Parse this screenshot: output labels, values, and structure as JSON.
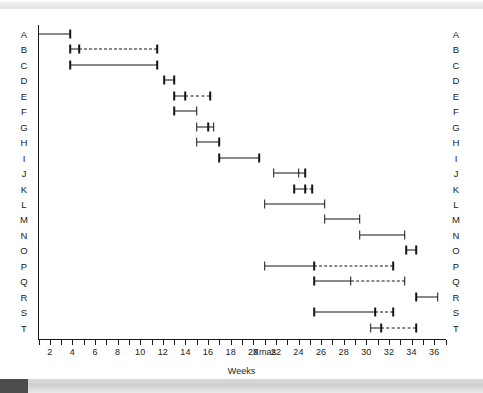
{
  "figure": {
    "type": "gantt",
    "x_axis_title": "Weeks",
    "row_labels_left": [
      "A",
      "B",
      "C",
      "D",
      "E",
      "F",
      "G",
      "H",
      "I",
      "J",
      "K",
      "L",
      "M",
      "N",
      "O",
      "P",
      "Q",
      "R",
      "S",
      "T"
    ],
    "row_labels_right": [
      "A",
      "B",
      "C",
      "D",
      "E",
      "F",
      "G",
      "H",
      "I",
      "J",
      "K",
      "L",
      "M",
      "N",
      "O",
      "P",
      "Q",
      "R",
      "S",
      "T"
    ],
    "axis_color": "#141414"
  },
  "chart_data": {
    "type": "bar",
    "title": "",
    "xlabel": "Weeks",
    "ylabel": "",
    "xlim": [
      1,
      37
    ],
    "grid": false,
    "legend": null,
    "x_ticks": [
      {
        "value": 1,
        "label": ""
      },
      {
        "value": 2,
        "label": "2"
      },
      {
        "value": 3,
        "label": ""
      },
      {
        "value": 4,
        "label": "4"
      },
      {
        "value": 5,
        "label": ""
      },
      {
        "value": 6,
        "label": "6"
      },
      {
        "value": 7,
        "label": ""
      },
      {
        "value": 8,
        "label": "8"
      },
      {
        "value": 9,
        "label": ""
      },
      {
        "value": 10,
        "label": "10"
      },
      {
        "value": 11,
        "label": ""
      },
      {
        "value": 12,
        "label": "12"
      },
      {
        "value": 13,
        "label": ""
      },
      {
        "value": 14,
        "label": "14"
      },
      {
        "value": 15,
        "label": ""
      },
      {
        "value": 16,
        "label": "16"
      },
      {
        "value": 17,
        "label": ""
      },
      {
        "value": 18,
        "label": "18"
      },
      {
        "value": 19,
        "label": ""
      },
      {
        "value": 20,
        "label": "20"
      },
      {
        "value": 21,
        "label": "Xmas"
      },
      {
        "value": 22,
        "label": "22"
      },
      {
        "value": 23,
        "label": ""
      },
      {
        "value": 24,
        "label": "24"
      },
      {
        "value": 25,
        "label": ""
      },
      {
        "value": 26,
        "label": "26"
      },
      {
        "value": 27,
        "label": ""
      },
      {
        "value": 28,
        "label": "28"
      },
      {
        "value": 29,
        "label": ""
      },
      {
        "value": 30,
        "label": "30"
      },
      {
        "value": 31,
        "label": ""
      },
      {
        "value": 32,
        "label": "32"
      },
      {
        "value": 33,
        "label": ""
      },
      {
        "value": 34,
        "label": "34"
      },
      {
        "value": 35,
        "label": ""
      },
      {
        "value": 36,
        "label": "36"
      },
      {
        "value": 37,
        "label": ""
      }
    ],
    "tasks": [
      {
        "label": "A",
        "solid_start": 1.0,
        "solid_end": 3.8,
        "dashed_start": null,
        "dashed_end": null,
        "start_cap": false,
        "mid_cap": false,
        "end_cap": true
      },
      {
        "label": "B",
        "solid_start": 3.8,
        "solid_end": 4.6,
        "dashed_start": 4.6,
        "dashed_end": 11.5,
        "start_cap": true,
        "mid_cap": true,
        "end_cap": true
      },
      {
        "label": "C",
        "solid_start": 3.8,
        "solid_end": 11.5,
        "dashed_start": null,
        "dashed_end": null,
        "start_cap": true,
        "mid_cap": false,
        "end_cap": true
      },
      {
        "label": "D",
        "solid_start": 12.1,
        "solid_end": 13.0,
        "dashed_start": null,
        "dashed_end": null,
        "start_cap": true,
        "mid_cap": false,
        "end_cap": true
      },
      {
        "label": "E",
        "solid_start": 13.0,
        "solid_end": 14.0,
        "dashed_start": 14.0,
        "dashed_end": 16.2,
        "start_cap": true,
        "mid_cap": true,
        "end_cap": true
      },
      {
        "label": "F",
        "solid_start": 13.0,
        "solid_end": 15.0,
        "dashed_start": null,
        "dashed_end": null,
        "start_cap": true,
        "mid_cap": false,
        "end_cap": true
      },
      {
        "label": "G",
        "solid_start": 15.0,
        "solid_end": 16.0,
        "dashed_start": 16.0,
        "dashed_end": 16.5,
        "start_cap": true,
        "mid_cap": true,
        "end_cap": true
      },
      {
        "label": "H",
        "solid_start": 15.0,
        "solid_end": 17.0,
        "dashed_start": null,
        "dashed_end": null,
        "start_cap": true,
        "mid_cap": false,
        "end_cap": true
      },
      {
        "label": "I",
        "solid_start": 17.0,
        "solid_end": 20.5,
        "dashed_start": null,
        "dashed_end": null,
        "start_cap": true,
        "mid_cap": false,
        "end_cap": true
      },
      {
        "label": "J",
        "solid_start": 21.8,
        "solid_end": 24.0,
        "dashed_start": 24.0,
        "dashed_end": 24.6,
        "start_cap": true,
        "mid_cap": true,
        "end_cap": true
      },
      {
        "label": "K",
        "solid_start": 23.6,
        "solid_end": 24.6,
        "dashed_start": 24.6,
        "dashed_end": 25.2,
        "start_cap": true,
        "mid_cap": true,
        "end_cap": true
      },
      {
        "label": "L",
        "solid_start": 21.0,
        "solid_end": 26.3,
        "dashed_start": null,
        "dashed_end": null,
        "start_cap": true,
        "mid_cap": false,
        "end_cap": true
      },
      {
        "label": "M",
        "solid_start": 26.3,
        "solid_end": 29.4,
        "dashed_start": null,
        "dashed_end": null,
        "start_cap": true,
        "mid_cap": false,
        "end_cap": true
      },
      {
        "label": "N",
        "solid_start": 29.4,
        "solid_end": 33.4,
        "dashed_start": null,
        "dashed_end": null,
        "start_cap": true,
        "mid_cap": false,
        "end_cap": true
      },
      {
        "label": "O",
        "solid_start": 33.5,
        "solid_end": 34.4,
        "dashed_start": null,
        "dashed_end": null,
        "start_cap": true,
        "mid_cap": false,
        "end_cap": true
      },
      {
        "label": "P",
        "solid_start": 21.0,
        "solid_end": 25.4,
        "dashed_start": 25.4,
        "dashed_end": 32.4,
        "start_cap": true,
        "mid_cap": true,
        "end_cap": true
      },
      {
        "label": "Q",
        "solid_start": 25.4,
        "solid_end": 28.6,
        "dashed_start": 28.6,
        "dashed_end": 33.4,
        "start_cap": true,
        "mid_cap": true,
        "end_cap": true
      },
      {
        "label": "R",
        "solid_start": 34.4,
        "solid_end": 36.3,
        "dashed_start": null,
        "dashed_end": null,
        "start_cap": true,
        "mid_cap": false,
        "end_cap": true
      },
      {
        "label": "S",
        "solid_start": 25.4,
        "solid_end": 30.8,
        "dashed_start": 30.8,
        "dashed_end": 32.4,
        "start_cap": true,
        "mid_cap": true,
        "end_cap": true
      },
      {
        "label": "T",
        "solid_start": 30.4,
        "solid_end": 31.3,
        "dashed_start": 31.3,
        "dashed_end": 34.4,
        "start_cap": true,
        "mid_cap": true,
        "end_cap": true
      }
    ]
  }
}
